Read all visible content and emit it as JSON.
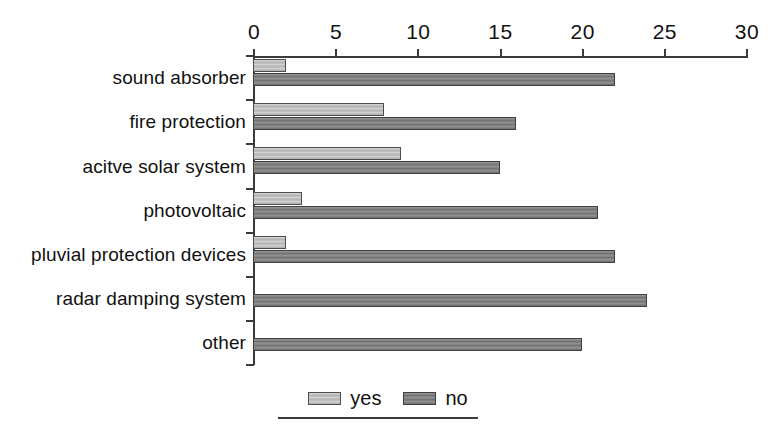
{
  "chart_data": {
    "type": "bar",
    "orientation": "horizontal",
    "title": "",
    "subtitle": "",
    "xlabel": "",
    "ylabel": "",
    "xlim": [
      0,
      30
    ],
    "xticks": [
      0,
      5,
      10,
      15,
      20,
      25,
      30
    ],
    "xtick_labels": [
      "0",
      "5",
      "10",
      "15",
      "20",
      "25",
      "30"
    ],
    "grid": false,
    "axis_position": "top",
    "legend_position": "bottom-center",
    "categories": [
      "sound absorber",
      "fire protection",
      "acitve solar system",
      "photovoltaic",
      "pluvial protection devices",
      "radar damping system",
      "other"
    ],
    "series": [
      {
        "name": "yes",
        "color": "#b9b9b9",
        "values": [
          2,
          8,
          9,
          3,
          2,
          0,
          0
        ]
      },
      {
        "name": "no",
        "color": "#7c7c7c",
        "values": [
          22,
          16,
          15,
          21,
          22,
          24,
          20
        ]
      }
    ]
  },
  "legend": {
    "entries": [
      {
        "label": "yes",
        "swatch": "light-gray-swatch-icon"
      },
      {
        "label": "no",
        "swatch": "dark-gray-swatch-icon"
      }
    ]
  },
  "colors": {
    "yes_fill": "#b9b9b9",
    "no_fill": "#7c7c7c",
    "axis": "#3a3a3a",
    "text": "#111111",
    "background": "#ffffff"
  }
}
